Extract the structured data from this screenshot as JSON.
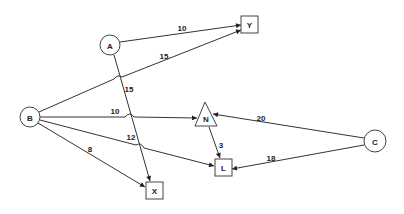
{
  "diagram": {
    "colors": {
      "line": "#333333",
      "node_border": "#444444",
      "background": "#ffffff",
      "text": "#222222"
    },
    "nodes": [
      {
        "id": "A",
        "label": "A",
        "shape": "circle",
        "x": 110,
        "y": 45,
        "r": 10
      },
      {
        "id": "Y",
        "label": "Y",
        "shape": "square",
        "x": 250,
        "y": 24,
        "size": 17
      },
      {
        "id": "B",
        "label": "B",
        "shape": "circle",
        "x": 30,
        "y": 117,
        "r": 10
      },
      {
        "id": "N",
        "label": "N",
        "shape": "triangle",
        "x": 206,
        "y": 117
      },
      {
        "id": "C",
        "label": "C",
        "shape": "circle",
        "x": 375,
        "y": 141,
        "r": 11
      },
      {
        "id": "L",
        "label": "L",
        "shape": "square",
        "x": 223,
        "y": 167,
        "size": 17
      },
      {
        "id": "X",
        "label": "X",
        "shape": "square",
        "x": 154,
        "y": 190,
        "size": 17
      }
    ],
    "edges": [
      {
        "from": "A",
        "to": "Y",
        "label": "10"
      },
      {
        "from": "B",
        "to": "Y",
        "label": "15"
      },
      {
        "from": "A",
        "to": "X",
        "label": "15"
      },
      {
        "from": "B",
        "to": "N",
        "label": "10"
      },
      {
        "from": "B",
        "to": "L",
        "label": "12"
      },
      {
        "from": "B",
        "to": "X",
        "label": "8"
      },
      {
        "from": "N",
        "to": "L",
        "label": "3"
      },
      {
        "from": "C",
        "to": "N",
        "label": "20"
      },
      {
        "from": "C",
        "to": "L",
        "label": "18"
      }
    ]
  }
}
